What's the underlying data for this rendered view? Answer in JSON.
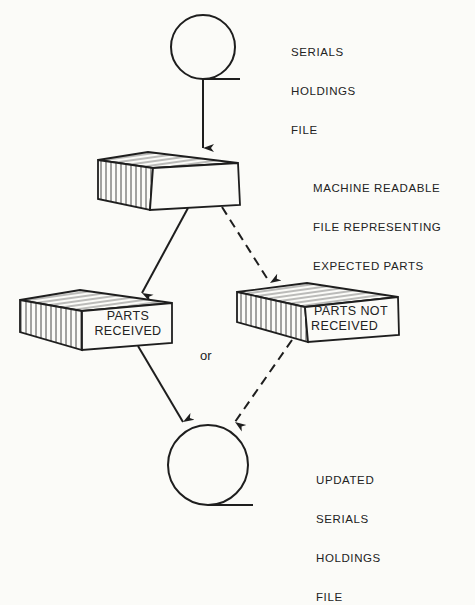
{
  "diagram": {
    "type": "flowchart",
    "nodes": [
      {
        "id": "serials_holdings_file",
        "shape": "magnetic-tape",
        "label_lines": [
          "SERIALS",
          "HOLDINGS",
          "FILE"
        ]
      },
      {
        "id": "expected_parts_file",
        "shape": "card-deck",
        "label_lines": [
          "MACHINE READABLE",
          "FILE REPRESENTING",
          "EXPECTED PARTS"
        ]
      },
      {
        "id": "parts_received",
        "shape": "card-deck",
        "text_lines": [
          "PARTS",
          "RECEIVED"
        ]
      },
      {
        "id": "parts_not_received",
        "shape": "card-deck",
        "text_lines": [
          "PARTS NOT",
          "RECEIVED"
        ]
      },
      {
        "id": "updated_serials_holdings_file",
        "shape": "magnetic-tape",
        "label_lines": [
          "UPDATED",
          "SERIALS",
          "HOLDINGS",
          "FILE"
        ]
      }
    ],
    "edges": [
      {
        "from": "serials_holdings_file",
        "to": "expected_parts_file",
        "style": "solid"
      },
      {
        "from": "expected_parts_file",
        "to": "parts_received",
        "style": "solid"
      },
      {
        "from": "expected_parts_file",
        "to": "parts_not_received",
        "style": "dashed"
      },
      {
        "from": "parts_received",
        "to": "updated_serials_holdings_file",
        "style": "solid"
      },
      {
        "from": "parts_not_received",
        "to": "updated_serials_holdings_file",
        "style": "dashed"
      }
    ],
    "connector_text": "or"
  },
  "labels": {
    "top_tape": [
      "SERIALS",
      "HOLDINGS",
      "FILE"
    ],
    "middle_deck": [
      "MACHINE READABLE",
      "FILE REPRESENTING",
      "EXPECTED PARTS"
    ],
    "received_deck": [
      "PARTS",
      "RECEIVED"
    ],
    "not_received_deck": [
      "PARTS NOT",
      "RECEIVED"
    ],
    "or": "or",
    "bottom_tape": [
      "UPDATED",
      "SERIALS",
      "HOLDINGS",
      "FILE"
    ]
  },
  "colors": {
    "ink": "#1e1e1e",
    "paper": "#fbfbf8"
  }
}
